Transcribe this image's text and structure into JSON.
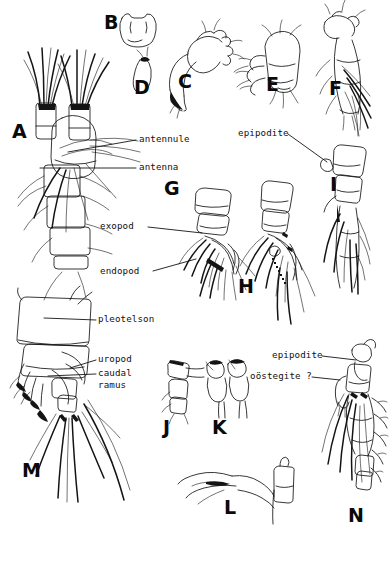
{
  "figure": {
    "background_color": "#ffffff",
    "ink_color": "#101010",
    "width": 389,
    "height": 563
  },
  "panels": [
    {
      "id": "A",
      "letter": "A",
      "x": 12,
      "y": 122,
      "size": "lg",
      "subject": "whole-animal-anterior-with-antennae"
    },
    {
      "id": "B",
      "letter": "B",
      "x": 104,
      "y": 13,
      "size": "lg",
      "subject": "labrum-or-paragnath"
    },
    {
      "id": "C",
      "letter": "C",
      "x": 178,
      "y": 72,
      "size": "lg",
      "subject": "mandible-with-palp"
    },
    {
      "id": "D",
      "letter": "D",
      "x": 134,
      "y": 78,
      "size": "lg",
      "subject": "maxillule"
    },
    {
      "id": "E",
      "letter": "E",
      "x": 266,
      "y": 75,
      "size": "lg",
      "subject": "maxilla"
    },
    {
      "id": "F",
      "letter": "F",
      "x": 329,
      "y": 79,
      "size": "lg",
      "subject": "maxilliped"
    },
    {
      "id": "G",
      "letter": "G",
      "x": 164,
      "y": 179,
      "size": "lg",
      "subject": "pereopod-1"
    },
    {
      "id": "H",
      "letter": "H",
      "x": 238,
      "y": 277,
      "size": "lg",
      "subject": "pereopod-2"
    },
    {
      "id": "I",
      "letter": "I",
      "x": 330,
      "y": 175,
      "size": "lg",
      "subject": "pereopod-3"
    },
    {
      "id": "J",
      "letter": "J",
      "x": 163,
      "y": 418,
      "size": "lg",
      "subject": "pleopod"
    },
    {
      "id": "K",
      "letter": "K",
      "x": 212,
      "y": 418,
      "size": "lg",
      "subject": "paired-pleopods"
    },
    {
      "id": "L",
      "letter": "L",
      "x": 224,
      "y": 498,
      "size": "lg",
      "subject": "uropod-detail"
    },
    {
      "id": "M",
      "letter": "M",
      "x": 22,
      "y": 461,
      "size": "lg",
      "subject": "pleotelson-and-uropods"
    },
    {
      "id": "N",
      "letter": "N",
      "x": 348,
      "y": 506,
      "size": "lg",
      "subject": "pereopod-with-oostegite"
    }
  ],
  "labels": [
    {
      "id": "antennule",
      "text": "antennule",
      "x": 139,
      "y": 134,
      "leader": {
        "x1": 136,
        "y1": 140,
        "x2": 68,
        "y2": 152
      }
    },
    {
      "id": "antenna",
      "text": "antenna",
      "x": 139,
      "y": 162,
      "leader": {
        "x1": 136,
        "y1": 168,
        "x2": 40,
        "y2": 168
      }
    },
    {
      "id": "exopod",
      "text": "exopod",
      "x": 100,
      "y": 221,
      "leader": {
        "x1": 148,
        "y1": 227,
        "x2": 202,
        "y2": 233
      }
    },
    {
      "id": "endopod",
      "text": "endopod",
      "x": 100,
      "y": 266,
      "leader": {
        "x1": 153,
        "y1": 271,
        "x2": 196,
        "y2": 259
      }
    },
    {
      "id": "epipodite-i",
      "text": "epipodite",
      "x": 238,
      "y": 128,
      "leader": {
        "x1": 288,
        "y1": 134,
        "x2": 327,
        "y2": 162
      }
    },
    {
      "id": "pleotelson",
      "text": "pleotelson",
      "x": 98,
      "y": 314,
      "leader": {
        "x1": 96,
        "y1": 320,
        "x2": 44,
        "y2": 318
      }
    },
    {
      "id": "uropod",
      "text": "uropod",
      "x": 98,
      "y": 354,
      "leader": {
        "x1": 96,
        "y1": 360,
        "x2": 70,
        "y2": 368
      }
    },
    {
      "id": "caudal-ramus",
      "text": "caudal",
      "x": 98,
      "y": 368,
      "leader": {
        "x1": 96,
        "y1": 374,
        "x2": 48,
        "y2": 376
      }
    },
    {
      "id": "caudal-ramus-2",
      "text": "ramus",
      "x": 98,
      "y": 380,
      "leader": null
    },
    {
      "id": "epipodite-n",
      "text": "epipodite",
      "x": 272,
      "y": 350,
      "leader": {
        "x1": 322,
        "y1": 356,
        "x2": 356,
        "y2": 360
      }
    },
    {
      "id": "oostegite",
      "text": "oöstegite ?",
      "x": 250,
      "y": 371,
      "leader": {
        "x1": 312,
        "y1": 377,
        "x2": 340,
        "y2": 380
      }
    }
  ]
}
